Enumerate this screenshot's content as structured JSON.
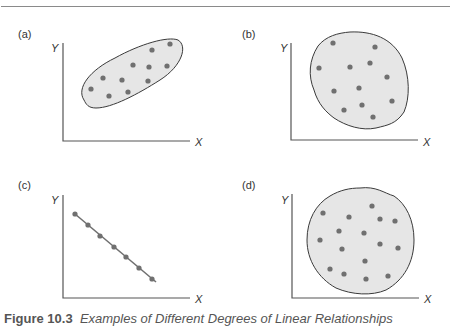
{
  "figure": {
    "caption_number": "Figure 10.3",
    "caption_text": "Examples of Different Degrees of Linear Relationships",
    "colors": {
      "axis": "#555555",
      "blob_fill": "#e6e6e6",
      "blob_stroke": "#3a3a3a",
      "dot": "#707070",
      "rule": "#8a8a8a"
    },
    "panels": [
      {
        "label": "(a)",
        "x_label": "X",
        "y_label": "Y",
        "description": "positive correlation, elongated elliptical cloud",
        "points": [
          [
            170,
            44
          ],
          [
            152,
            50
          ],
          [
            133,
            65
          ],
          [
            149,
            67
          ],
          [
            167,
            66
          ],
          [
            103,
            78
          ],
          [
            122,
            80
          ],
          [
            148,
            81
          ],
          [
            91,
            89
          ],
          [
            128,
            92
          ],
          [
            109,
            96
          ]
        ]
      },
      {
        "label": "(b)",
        "x_label": "X",
        "y_label": "Y",
        "description": "no correlation, roughly circular cloud",
        "points": [
          [
            333,
            43
          ],
          [
            375,
            47
          ],
          [
            319,
            68
          ],
          [
            350,
            67
          ],
          [
            370,
            63
          ],
          [
            387,
            77
          ],
          [
            334,
            91
          ],
          [
            359,
            88
          ],
          [
            392,
            101
          ],
          [
            344,
            110
          ],
          [
            362,
            105
          ],
          [
            373,
            117
          ]
        ]
      },
      {
        "label": "(c)",
        "x_label": "X",
        "y_label": "Y",
        "description": "perfect negative linear relationship",
        "points": [
          [
            75,
            214
          ],
          [
            88,
            225
          ],
          [
            100,
            236
          ],
          [
            114,
            247
          ],
          [
            126,
            257
          ],
          [
            139,
            268
          ],
          [
            152,
            279
          ]
        ]
      },
      {
        "label": "(d)",
        "x_label": "X",
        "y_label": "Y",
        "description": "no correlation, circular cloud",
        "points": [
          [
            372,
            206
          ],
          [
            323,
            213
          ],
          [
            349,
            217
          ],
          [
            380,
            219
          ],
          [
            395,
            221
          ],
          [
            339,
            231
          ],
          [
            364,
            233
          ],
          [
            320,
            240
          ],
          [
            380,
            244
          ],
          [
            342,
            249
          ],
          [
            398,
            248
          ],
          [
            365,
            261
          ],
          [
            330,
            269
          ],
          [
            344,
            274
          ],
          [
            366,
            279
          ],
          [
            388,
            276
          ]
        ]
      }
    ]
  }
}
